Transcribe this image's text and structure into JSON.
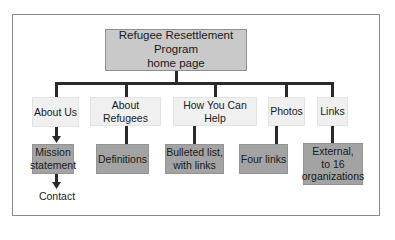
{
  "diagram": {
    "root": {
      "label_line1": "Refugee Resettlement Program",
      "label_line2": "home page"
    },
    "sections": [
      {
        "label": "About Us",
        "child_line1": "Mission",
        "child_line2": "statement",
        "grandchild": "Contact"
      },
      {
        "label": "About Refugees",
        "child_line1": "Definitions"
      },
      {
        "label": "How You Can Help",
        "child_line1": "Bulleted list,",
        "child_line2": "with links"
      },
      {
        "label": "Photos",
        "child_line1": "Four links"
      },
      {
        "label": "Links",
        "child_line1": "External,",
        "child_line2": "to 16",
        "child_line3": "organizations"
      }
    ]
  },
  "colors": {
    "root_fill": "#c9c9c9",
    "section_fill": "#f0f0f0",
    "child_fill": "#a3a3a3",
    "connector": "#2a2a2a",
    "frame": "#8a8a8a"
  }
}
